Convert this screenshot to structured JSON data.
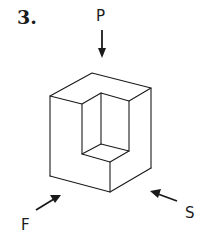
{
  "problem": {
    "number": "3."
  },
  "view_labels": {
    "top": "P",
    "front": "F",
    "side": "S"
  },
  "figure": {
    "stroke_color": "#1a1a1a",
    "background": "#ffffff"
  }
}
